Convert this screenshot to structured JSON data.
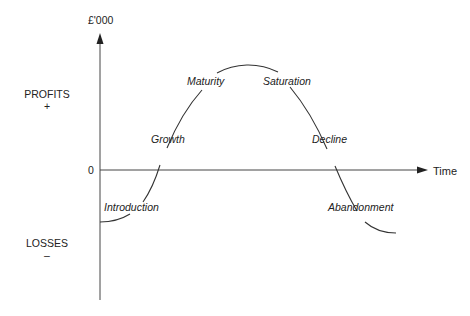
{
  "diagram": {
    "y_axis_label": "£'000",
    "x_axis_label": "Time",
    "zero_label": "0",
    "profits": {
      "label": "PROFITS",
      "sign": "+"
    },
    "losses": {
      "label": "LOSSES",
      "sign": "–"
    },
    "stages": [
      {
        "name": "Introduction"
      },
      {
        "name": "Growth"
      },
      {
        "name": "Maturity"
      },
      {
        "name": "Saturation"
      },
      {
        "name": "Decline"
      },
      {
        "name": "Abandonment"
      }
    ],
    "colors": {
      "line": "#333333",
      "text": "#222222",
      "background": "#ffffff"
    }
  }
}
